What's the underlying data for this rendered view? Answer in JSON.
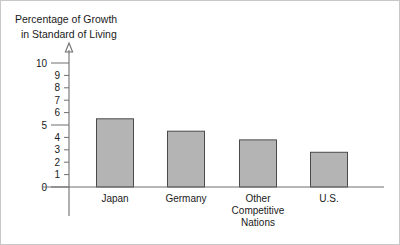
{
  "chart_data": {
    "type": "bar",
    "title": "",
    "ylabel_lines": [
      "Percentage of Growth",
      "in Standard of Living"
    ],
    "xlabel": "",
    "categories": [
      "Japan",
      "Germany",
      "Other Competitive Nations",
      "U.S."
    ],
    "category_label_lines": [
      [
        "Japan"
      ],
      [
        "Germany"
      ],
      [
        "Other",
        "Competitive",
        "Nations"
      ],
      [
        "U.S."
      ]
    ],
    "values": [
      5.5,
      4.5,
      3.8,
      2.8
    ],
    "ylim": [
      0,
      10
    ],
    "yticks": [
      0,
      1,
      2,
      3,
      4,
      5,
      6,
      7,
      8,
      9,
      10
    ],
    "ytick_labels": [
      "0",
      "1",
      "2",
      "3",
      "4",
      "5",
      "6",
      "7",
      "8",
      "9",
      "10"
    ],
    "major_yticks": [
      0,
      5,
      10
    ],
    "grid": false,
    "legend": null,
    "bar_fill_color": "#b4b4b4",
    "bar_edge_color": "#4a4a4a",
    "axis_color": "#6f6f6f",
    "text_color": "#1a1a1a",
    "background_color": "#ffffff",
    "y_axis_has_arrow": true
  }
}
